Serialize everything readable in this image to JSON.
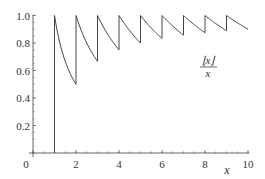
{
  "chart_data": {
    "type": "line",
    "title": "",
    "xlabel": "x",
    "ylabel": "",
    "xlim": [
      0,
      10
    ],
    "ylim": [
      0,
      1
    ],
    "grid": false,
    "legend": null,
    "annotation": {
      "numerator": "⌊x⌋",
      "denominator": "x",
      "position": [
        8.0,
        0.68
      ]
    },
    "x_ticks": [
      0,
      2,
      4,
      6,
      8,
      10
    ],
    "x_tick_labels": [
      "0",
      "2",
      "4",
      "6",
      "8",
      "10"
    ],
    "y_ticks": [
      0.2,
      0.4,
      0.6,
      0.8,
      1.0
    ],
    "y_tick_labels": [
      "0.2",
      "0.4",
      "0.6",
      "0.8",
      "1.0"
    ],
    "x_minor_step": 0.5,
    "y_minor_step": 0.05,
    "series": [
      {
        "name": "floor(x)/x",
        "function": "floor(x)/x",
        "vertical_jump": {
          "x": 1,
          "from": 0,
          "to": 1
        },
        "segments": [
          {
            "x_start": 1,
            "y_start": 1.0,
            "x_end": 2,
            "y_end": 0.5
          },
          {
            "x_start": 2,
            "y_start": 1.0,
            "x_end": 3,
            "y_end": 0.667
          },
          {
            "x_start": 3,
            "y_start": 1.0,
            "x_end": 4,
            "y_end": 0.75
          },
          {
            "x_start": 4,
            "y_start": 1.0,
            "x_end": 5,
            "y_end": 0.8
          },
          {
            "x_start": 5,
            "y_start": 1.0,
            "x_end": 6,
            "y_end": 0.833
          },
          {
            "x_start": 6,
            "y_start": 1.0,
            "x_end": 7,
            "y_end": 0.857
          },
          {
            "x_start": 7,
            "y_start": 1.0,
            "x_end": 8,
            "y_end": 0.875
          },
          {
            "x_start": 8,
            "y_start": 1.0,
            "x_end": 9,
            "y_end": 0.889
          },
          {
            "x_start": 9,
            "y_start": 1.0,
            "x_end": 10,
            "y_end": 0.9
          }
        ]
      }
    ]
  },
  "colors": {
    "curve": "#444444",
    "axis": "#555555",
    "text": "#333333"
  }
}
